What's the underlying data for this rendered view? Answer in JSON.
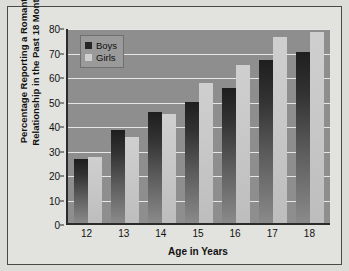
{
  "chart_data": {
    "type": "bar",
    "title": "",
    "xlabel": "Age in Years",
    "ylabel": "Percentage Reporting a Romantic Relationship in the Past 18 Months",
    "ylabel_line1": "Percentage Reporting a Romantic",
    "ylabel_line2": "Relationship in the Past 18 Months",
    "categories": [
      "12",
      "13",
      "14",
      "15",
      "16",
      "17",
      "18"
    ],
    "series": [
      {
        "name": "Boys",
        "color": "#262626",
        "values": [
          26,
          38,
          45.5,
          49.5,
          55,
          66.5,
          70
        ]
      },
      {
        "name": "Girls",
        "color": "#cfcfcf",
        "values": [
          27,
          35,
          44.5,
          57,
          64.5,
          76,
          78
        ]
      }
    ],
    "ylim": [
      0,
      80
    ],
    "ytick_step": 10,
    "yticks": [
      "0",
      "10",
      "20",
      "30",
      "40",
      "50",
      "60",
      "70",
      "80"
    ],
    "grid": true,
    "legend_position": "top-left",
    "plot_background": "#8e8e8e",
    "gridline_color": "#e6e6e6",
    "axis_color": "#2b2b2b",
    "figure_background": "#e2e2de"
  }
}
